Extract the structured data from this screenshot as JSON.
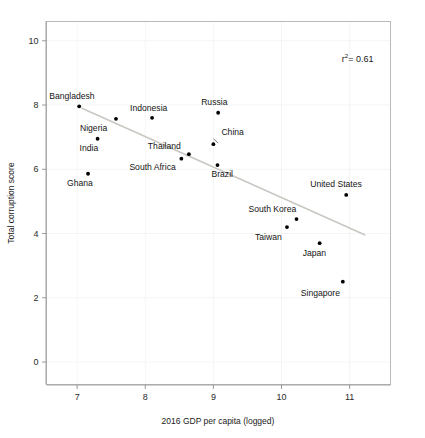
{
  "chart_data": {
    "type": "scatter",
    "title": "",
    "xlabel": "2016 GDP per capita (logged)",
    "ylabel": "Total corruption score",
    "xlim": [
      6.55,
      11.6
    ],
    "ylim": [
      -0.7,
      10.6
    ],
    "xticks": [
      7,
      8,
      9,
      10,
      11
    ],
    "xtick_labels": [
      "7",
      "8",
      "9",
      "10",
      "11"
    ],
    "yticks": [
      0,
      2,
      4,
      6,
      8,
      10
    ],
    "ytick_labels": [
      "0",
      "2",
      "4",
      "6",
      "8",
      "10"
    ],
    "grid": true,
    "legend": "none",
    "annotations": [
      {
        "name": "r-squared",
        "text_prefix": "r",
        "text_sup": "2",
        "text_suffix": "= 0.61",
        "full_text": "r² = 0.61",
        "value": 0.61,
        "x": 11.35,
        "y": 9.35
      }
    ],
    "trend_line": {
      "x": [
        7.07,
        11.22
      ],
      "y": [
        7.9,
        3.96
      ],
      "color": "#c9c7c2"
    },
    "point_color": "#000000",
    "points": [
      {
        "label": "Bangladesh",
        "x": 7.03,
        "y": 7.96,
        "label_dx": -30,
        "label_dy": -7,
        "anchor": "start"
      },
      {
        "label": "Nigeria",
        "x": 7.57,
        "y": 7.57,
        "label_dx": -36,
        "label_dy": 12,
        "anchor": "start"
      },
      {
        "label": "India",
        "x": 7.3,
        "y": 6.95,
        "label_dx": -18,
        "label_dy": 12,
        "anchor": "start"
      },
      {
        "label": "Ghana",
        "x": 7.16,
        "y": 5.86,
        "label_dx": -21,
        "label_dy": 12,
        "anchor": "start"
      },
      {
        "label": "Indonesia",
        "x": 8.1,
        "y": 7.6,
        "label_dx": -22,
        "label_dy": -7,
        "anchor": "start"
      },
      {
        "label": "Thailand",
        "x": 8.64,
        "y": 6.47,
        "label_dx": -41,
        "label_dy": -5,
        "anchor": "start"
      },
      {
        "label": "South Africa",
        "x": 8.53,
        "y": 6.33,
        "label_dx": -52,
        "label_dy": 11,
        "anchor": "start"
      },
      {
        "label": "Russia",
        "x": 9.07,
        "y": 7.76,
        "label_dx": -17,
        "label_dy": -8,
        "anchor": "start"
      },
      {
        "label": "China",
        "x": 9.0,
        "y": 6.78,
        "label_dx": 8,
        "label_dy": -9,
        "anchor": "start"
      },
      {
        "label": "Brazil",
        "x": 9.06,
        "y": 6.13,
        "label_dx": -6,
        "label_dy": 12,
        "anchor": "start"
      },
      {
        "label": "United States",
        "x": 10.95,
        "y": 5.2,
        "label_dx": -36,
        "label_dy": -8,
        "anchor": "start"
      },
      {
        "label": "South Korea",
        "x": 10.22,
        "y": 4.45,
        "label_dx": -48,
        "label_dy": -7,
        "anchor": "start"
      },
      {
        "label": "Taiwan",
        "x": 10.08,
        "y": 4.2,
        "label_dx": -32,
        "label_dy": 13,
        "anchor": "start"
      },
      {
        "label": "Japan",
        "x": 10.56,
        "y": 3.7,
        "label_dx": -17,
        "label_dy": 13,
        "anchor": "start"
      },
      {
        "label": "Singapore",
        "x": 10.9,
        "y": 2.5,
        "label_dx": -42,
        "label_dy": 14,
        "anchor": "start"
      }
    ],
    "leaders": [
      {
        "from_label": "China",
        "x1": 9.0,
        "y1": 6.95,
        "x2": 9.07,
        "y2": 6.82
      }
    ]
  }
}
